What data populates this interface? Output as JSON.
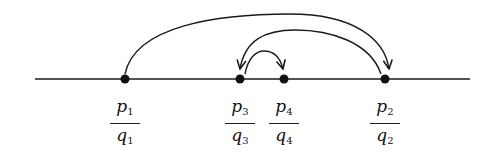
{
  "diagram": {
    "title": "",
    "line": {
      "x1": 35,
      "x2": 470,
      "y": 79,
      "color": "#1a1a1a"
    },
    "points": [
      {
        "id": "p1q1",
        "x": 125,
        "num": "p",
        "num_sub": "1",
        "den": "q",
        "den_sub": "1"
      },
      {
        "id": "p3q3",
        "x": 240,
        "num": "p",
        "num_sub": "3",
        "den": "q",
        "den_sub": "3"
      },
      {
        "id": "p4q4",
        "x": 284,
        "num": "p",
        "num_sub": "4",
        "den": "q",
        "den_sub": "4"
      },
      {
        "id": "p2q2",
        "x": 385,
        "num": "p",
        "num_sub": "2",
        "den": "q",
        "den_sub": "2"
      }
    ],
    "arcs": [
      {
        "from": "p1q1",
        "to": "p2q2",
        "label": ""
      },
      {
        "from": "p2q2",
        "to": "p3q3",
        "label": ""
      },
      {
        "from": "p3q3",
        "to": "p4q4",
        "label": ""
      }
    ]
  }
}
